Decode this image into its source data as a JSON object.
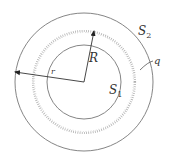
{
  "diagram": {
    "type": "concentric-spheres",
    "center": {
      "x": 84,
      "y": 82
    },
    "colors": {
      "line": "#666666",
      "dots": "#aaaaaa",
      "text": "#333333",
      "background": "#ffffff"
    },
    "surfaces": [
      {
        "id": "S1",
        "letter": "S",
        "subscript": "1",
        "radius": 37,
        "style": "solid"
      },
      {
        "id": "charge-shell",
        "radius": 51,
        "style": "dotted"
      },
      {
        "id": "S2",
        "letter": "S",
        "subscript": "2",
        "radius": 69,
        "style": "solid"
      }
    ],
    "labels": {
      "R": "R",
      "r": "r",
      "q": "q",
      "S1_letter": "S",
      "S1_sub": "1",
      "S2_letter": "S",
      "S2_sub": "2"
    },
    "arrows": [
      {
        "name": "radius-R",
        "label": "R",
        "to": "charge-shell"
      },
      {
        "name": "radius-r",
        "label": "r",
        "to": "S2"
      }
    ]
  }
}
